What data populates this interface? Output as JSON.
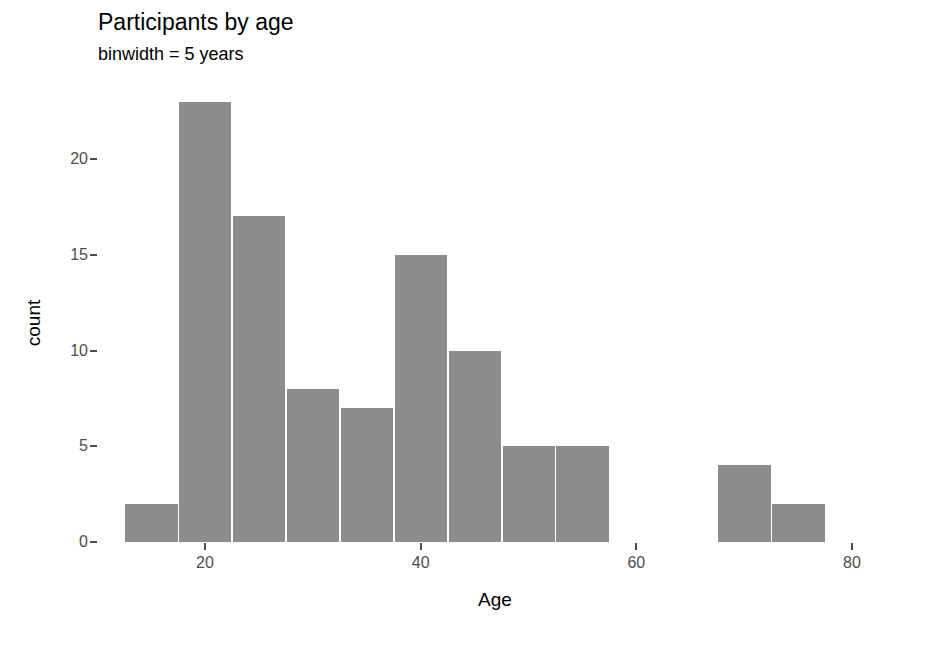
{
  "chart_data": {
    "type": "bar",
    "title": "Participants by age",
    "subtitle": "binwidth = 5 years",
    "xlabel": "Age",
    "ylabel": "count",
    "grid": false,
    "legend": "none",
    "binwidth": 5,
    "bar_color": "#8c8c8c",
    "xlim": [
      12.5,
      82.5
    ],
    "ylim": [
      0,
      23
    ],
    "x_ticks": [
      20,
      40,
      60,
      80
    ],
    "x_tick_labels": [
      "20",
      "40",
      "60",
      "80"
    ],
    "y_ticks": [
      0,
      5,
      10,
      15,
      20
    ],
    "y_tick_labels": [
      "0",
      "5",
      "10",
      "15",
      "20"
    ],
    "bins": [
      {
        "start": 12.5,
        "end": 17.5,
        "center": 15,
        "count": 2
      },
      {
        "start": 17.5,
        "end": 22.5,
        "center": 20,
        "count": 23
      },
      {
        "start": 22.5,
        "end": 27.5,
        "center": 25,
        "count": 17
      },
      {
        "start": 27.5,
        "end": 32.5,
        "center": 30,
        "count": 8
      },
      {
        "start": 32.5,
        "end": 37.5,
        "center": 35,
        "count": 7
      },
      {
        "start": 37.5,
        "end": 42.5,
        "center": 40,
        "count": 15
      },
      {
        "start": 42.5,
        "end": 47.5,
        "center": 45,
        "count": 10
      },
      {
        "start": 47.5,
        "end": 52.5,
        "center": 50,
        "count": 5
      },
      {
        "start": 52.5,
        "end": 57.5,
        "center": 55,
        "count": 5
      },
      {
        "start": 57.5,
        "end": 62.5,
        "center": 60,
        "count": 0
      },
      {
        "start": 62.5,
        "end": 67.5,
        "center": 65,
        "count": 0
      },
      {
        "start": 67.5,
        "end": 72.5,
        "center": 70,
        "count": 4
      },
      {
        "start": 72.5,
        "end": 77.5,
        "center": 75,
        "count": 2
      }
    ],
    "categories": [
      "15",
      "20",
      "25",
      "30",
      "35",
      "40",
      "45",
      "50",
      "55",
      "60",
      "65",
      "70",
      "75"
    ],
    "values": [
      2,
      23,
      17,
      8,
      7,
      15,
      10,
      5,
      5,
      0,
      0,
      4,
      2
    ]
  }
}
